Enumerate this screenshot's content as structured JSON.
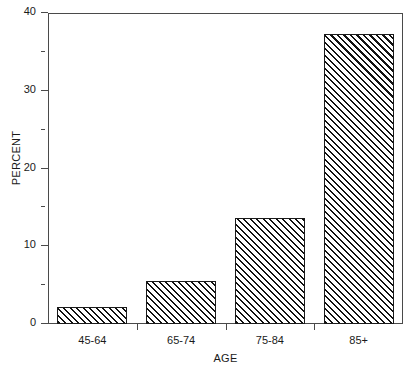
{
  "chart_data": {
    "type": "bar",
    "title": "",
    "subtitle": "",
    "xlabel": "AGE",
    "ylabel": "PERCENT",
    "categories": [
      "45-64",
      "65-74",
      "75-84",
      "85+"
    ],
    "values": [
      2.2,
      5.5,
      13.6,
      37.3
    ],
    "series": [
      {
        "name": "Percent",
        "values": [
          2.2,
          5.5,
          13.6,
          37.3
        ]
      }
    ],
    "ylim": [
      0,
      40
    ],
    "xlim_note": "categorical",
    "ytick_labels": [
      "0",
      "10",
      "20",
      "30",
      "40"
    ],
    "ytick_values": [
      0,
      10,
      20,
      30,
      40
    ],
    "yminor_values": [
      5,
      15,
      25,
      35
    ],
    "grid": false,
    "legend": false,
    "legend_position": "none",
    "bar_fill": "hatched-diagonal",
    "annotations": []
  },
  "style": {
    "axis_color": "#4a4a4a",
    "bar_edge_color": "#1a1a1a",
    "bar_hatch_color": "#111111",
    "background": "#ffffff",
    "text_color": "#1a1a1a"
  }
}
